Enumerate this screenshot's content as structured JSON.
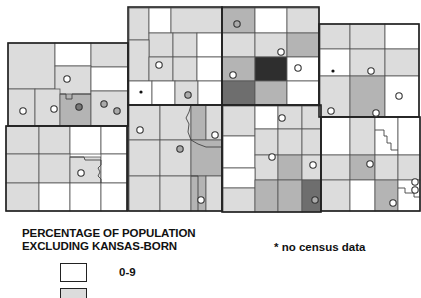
{
  "legend": {
    "title_line1": "PERCENTAGE OF POPULATION",
    "title_line2": "EXCLUDING KANSAS-BORN",
    "classes": [
      {
        "label": "0-9",
        "color": "#ffffff"
      },
      {
        "label": "",
        "color": "#dcdcdc"
      }
    ],
    "note": "* no census data"
  },
  "colors": {
    "white": "#ffffff",
    "light": "#dcdcdc",
    "medium": "#b4b4b4",
    "dark": "#6e6e6e",
    "darkest": "#2e2e2e",
    "border": "#222222",
    "inner_border": "#555555"
  },
  "symbols": {
    "open_circle": "hollow circle",
    "grey_dot": "filled grey circle",
    "asterisk": "no census data marker"
  }
}
